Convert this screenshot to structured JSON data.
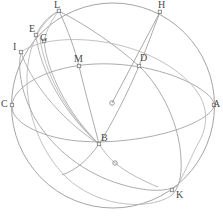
{
  "figure": {
    "type": "geometric-sphere-diagram",
    "width": 223,
    "height": 218,
    "background_color": "#ffffff",
    "stroke_color": "#9a9a9a",
    "stroke_color_light": "#b0b0b0",
    "label_color": "#4a4a4a",
    "marker_color": "#8f8f8f",
    "sphere": {
      "center_x": 113,
      "center_y": 105,
      "radius_x": 101,
      "radius_y": 102
    },
    "center_point": {
      "x": 112,
      "y": 103,
      "name": "sphere-center"
    },
    "points": [
      {
        "id": "L",
        "label": "L",
        "label_x": 54,
        "label_y": 0,
        "marker_x": 59,
        "marker_y": 11
      },
      {
        "id": "H",
        "label": "H",
        "label_x": 158,
        "label_y": 0,
        "marker_x": 160,
        "marker_y": 12
      },
      {
        "id": "E",
        "label": "E",
        "label_x": 29,
        "label_y": 24,
        "marker_x": 36,
        "marker_y": 35
      },
      {
        "id": "G",
        "label": "G",
        "label_x": 40,
        "label_y": 33,
        "marker_x": 44,
        "marker_y": 41
      },
      {
        "id": "I",
        "label": "I",
        "label_x": 13,
        "label_y": 42,
        "marker_x": 21,
        "marker_y": 52
      },
      {
        "id": "M",
        "label": "M",
        "label_x": 74,
        "label_y": 54,
        "marker_x": 79,
        "marker_y": 66
      },
      {
        "id": "D",
        "label": "D",
        "label_x": 140,
        "label_y": 53,
        "marker_x": 139,
        "marker_y": 66
      },
      {
        "id": "C",
        "label": "C",
        "label_x": 1,
        "label_y": 99,
        "marker_x": 12,
        "marker_y": 105
      },
      {
        "id": "A",
        "label": "A",
        "label_x": 213,
        "label_y": 99,
        "marker_x": 214,
        "marker_y": 105
      },
      {
        "id": "B",
        "label": "B",
        "label_x": 101,
        "label_y": 133,
        "marker_x": 99,
        "marker_y": 144
      },
      {
        "id": "K",
        "label": "K",
        "label_x": 176,
        "label_y": 190,
        "marker_x": 172,
        "marker_y": 190
      }
    ],
    "extra_markers": [
      {
        "id": "lower-node",
        "x": 115,
        "y": 163
      }
    ]
  }
}
